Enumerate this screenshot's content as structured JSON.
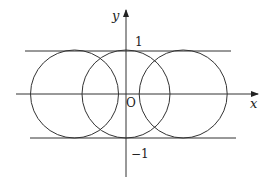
{
  "diagram": {
    "axes": {
      "x_label": "x",
      "y_label": "y",
      "origin_label": "O"
    },
    "tick_labels": {
      "top": "1",
      "bottom": "−1"
    },
    "lines": [
      {
        "name": "upper-line",
        "equation": "y = 1"
      },
      {
        "name": "lower-line",
        "equation": "y = -1"
      }
    ],
    "circles": [
      {
        "name": "left-circle",
        "center_x": -1.17,
        "center_y": 0,
        "radius": 1
      },
      {
        "name": "middle-circle",
        "center_x": 0,
        "center_y": 0,
        "radius": 1
      },
      {
        "name": "right-circle",
        "center_x": 1.3,
        "center_y": 0,
        "radius": 1
      }
    ],
    "colors": {
      "stroke": "#333333"
    }
  }
}
